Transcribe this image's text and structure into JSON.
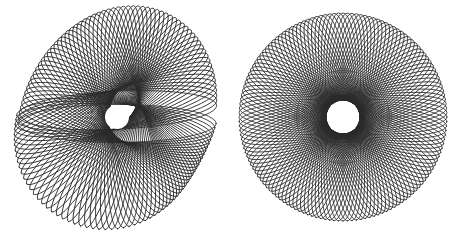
{
  "canvas": {
    "width": 456,
    "height": 239,
    "background": "#ffffff"
  },
  "figures": [
    {
      "name": "twisted-rosette",
      "cx": 117,
      "cy": 117,
      "petal_count": 64,
      "petal_length": 105,
      "petal_width": 19,
      "inner_radius": 12,
      "stroke": "#2a2a2a",
      "stroke_width": 0.85,
      "twist": true,
      "twist_amount": 0.55,
      "twist_axis_deg": 118
    },
    {
      "name": "regular-rosette",
      "cx": 343,
      "cy": 117,
      "petal_count": 72,
      "petal_length": 104,
      "petal_width": 17,
      "inner_radius": 13,
      "stroke": "#2a2a2a",
      "stroke_width": 0.8,
      "twist": false,
      "twist_amount": 0,
      "twist_axis_deg": 0
    }
  ]
}
